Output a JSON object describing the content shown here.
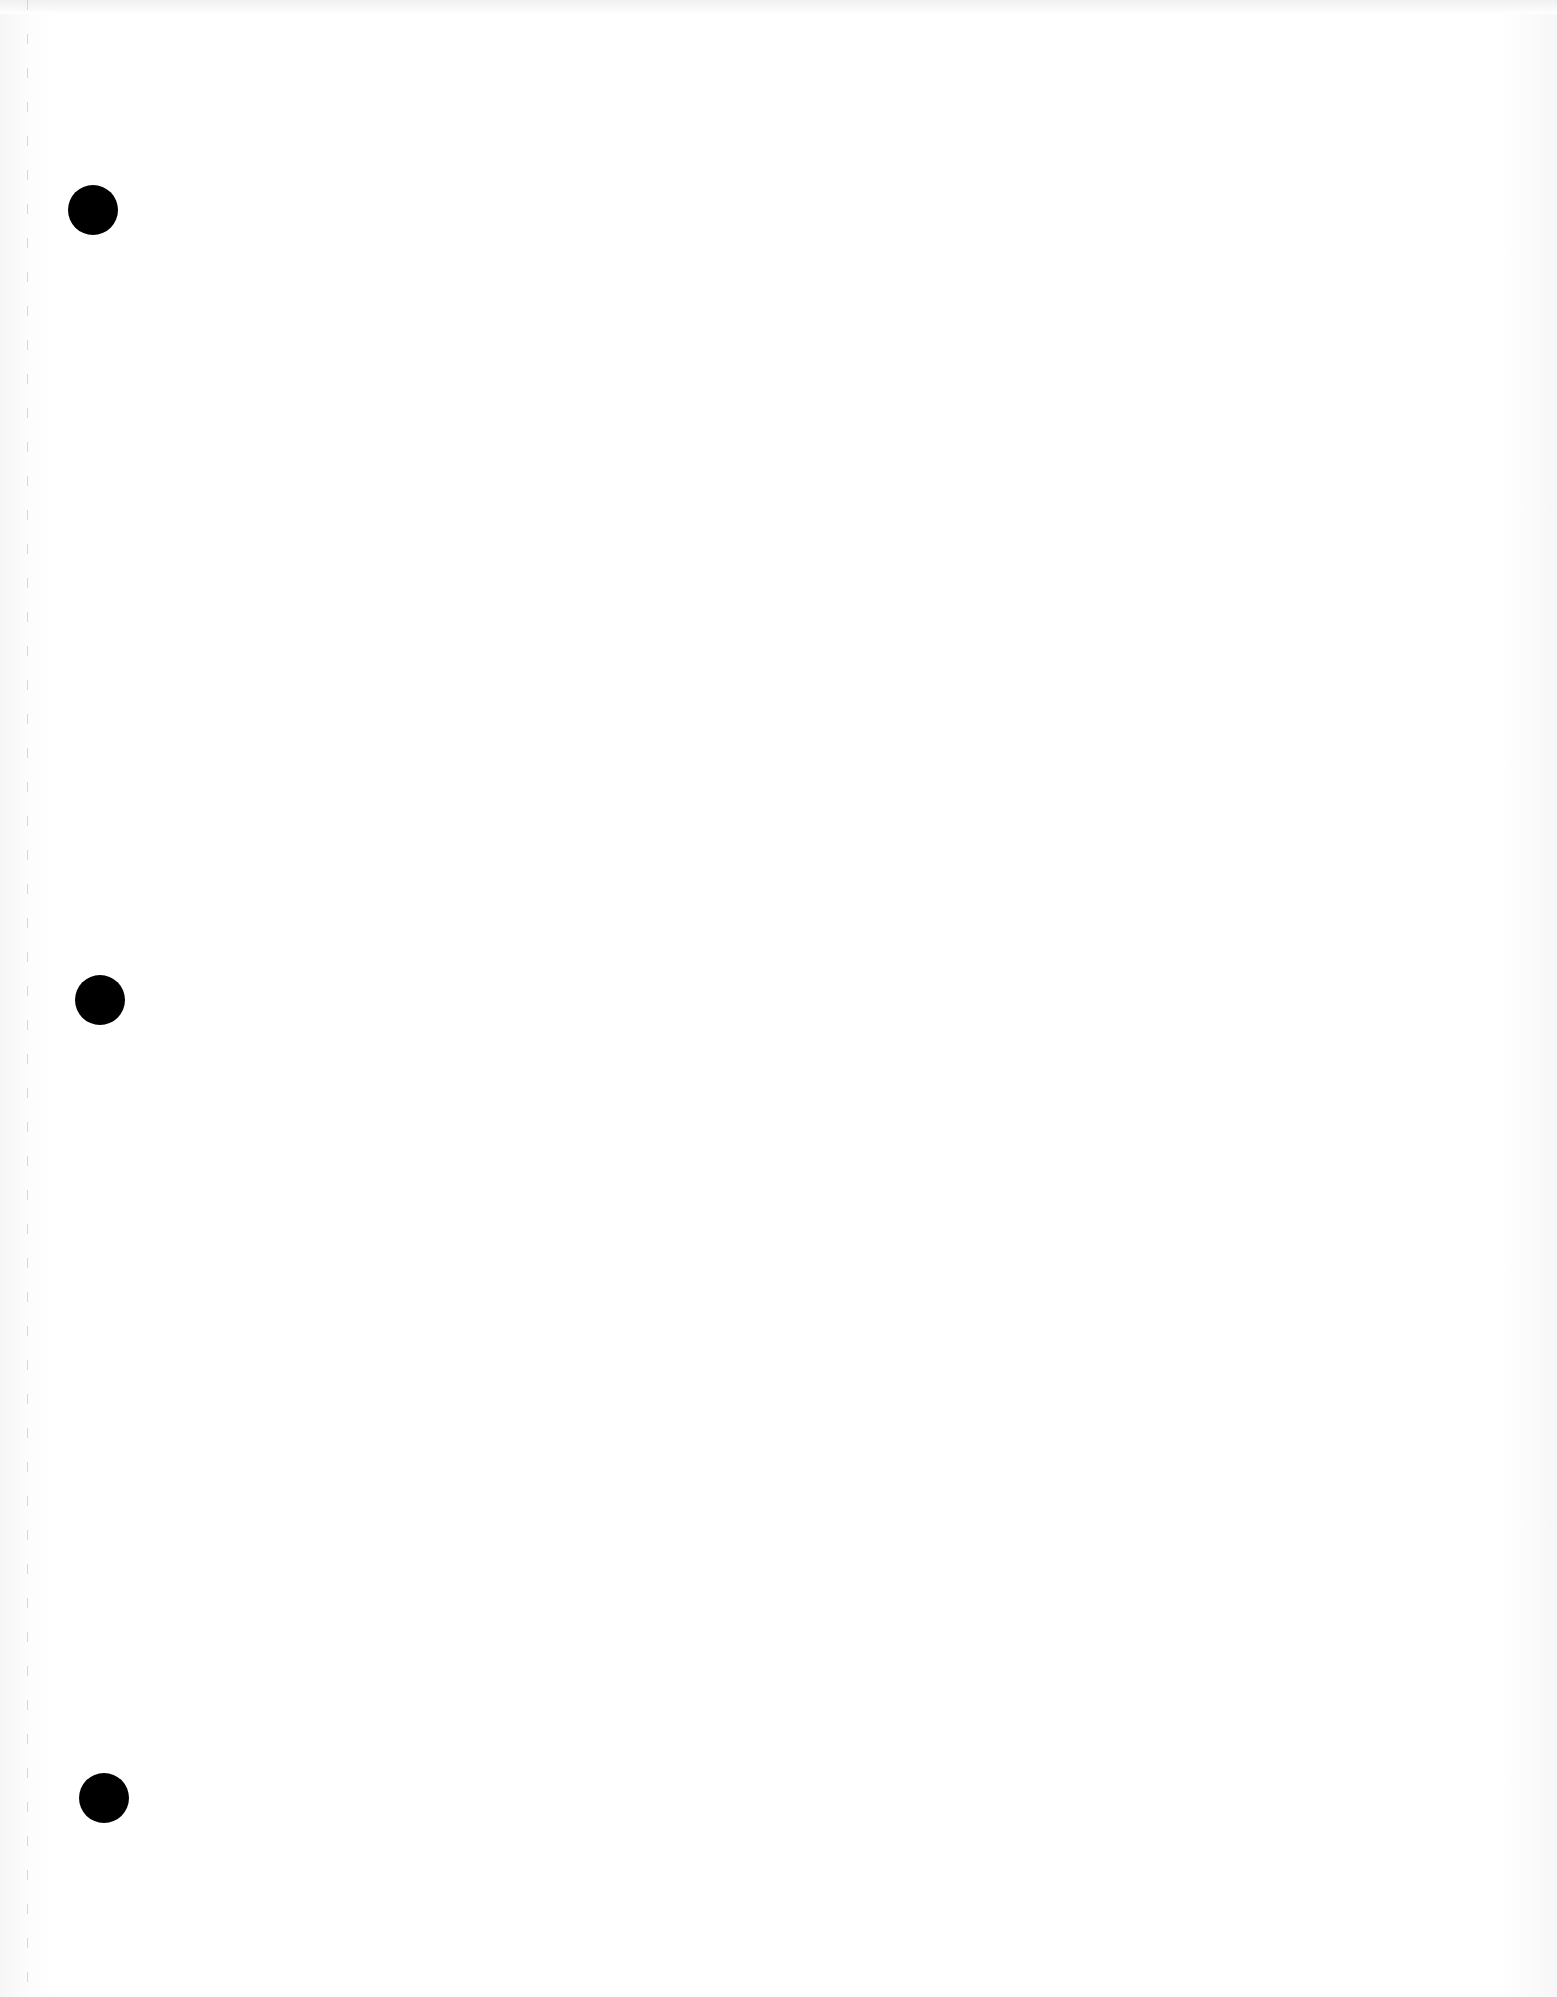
{
  "page": {
    "background_color": "#ffffff",
    "type": "blank-punched-sheet"
  },
  "perforation": {
    "color": "#c8c8c8",
    "x": 27
  },
  "punch_holes": [
    {
      "label": "top",
      "cx": 93,
      "cy": 210,
      "r": 25,
      "color": "#000000"
    },
    {
      "label": "middle",
      "cx": 100,
      "cy": 1000,
      "r": 25,
      "color": "#000000"
    },
    {
      "label": "bottom",
      "cx": 104,
      "cy": 1798,
      "r": 25,
      "color": "#000000"
    }
  ]
}
